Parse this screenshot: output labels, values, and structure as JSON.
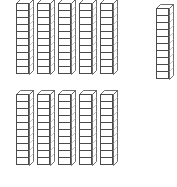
{
  "manipulative": {
    "name": "base-ten-blocks",
    "block_type": "rod",
    "units_per_rod": 10,
    "rod_count": 11,
    "total_units": 110,
    "colors": {
      "background": "#ffffff",
      "outline": "#4a4a4a",
      "face_fill": "#ffffff",
      "shade": "#b8b8b8"
    },
    "geometry": {
      "cube_width": 13,
      "cube_height": 8,
      "depth_x": 4,
      "depth_y": 4
    },
    "groups": [
      {
        "name": "top-row-group",
        "rod_count": 5,
        "start_x": 16,
        "start_y": 3,
        "spacing_x": 21,
        "rods": [
          {
            "label": "rod-1",
            "units": 10
          },
          {
            "label": "rod-2",
            "units": 10
          },
          {
            "label": "rod-3",
            "units": 10
          },
          {
            "label": "rod-4",
            "units": 10
          },
          {
            "label": "rod-5",
            "units": 10
          }
        ]
      },
      {
        "name": "top-right-single",
        "rod_count": 1,
        "start_x": 156,
        "start_y": 8,
        "spacing_x": 21,
        "rods": [
          {
            "label": "rod-6",
            "units": 10
          }
        ]
      },
      {
        "name": "bottom-row-group",
        "rod_count": 5,
        "start_x": 16,
        "start_y": 94,
        "spacing_x": 21,
        "rods": [
          {
            "label": "rod-7",
            "units": 10
          },
          {
            "label": "rod-8",
            "units": 10
          },
          {
            "label": "rod-9",
            "units": 10
          },
          {
            "label": "rod-10",
            "units": 10
          },
          {
            "label": "rod-11",
            "units": 10
          }
        ]
      }
    ]
  }
}
